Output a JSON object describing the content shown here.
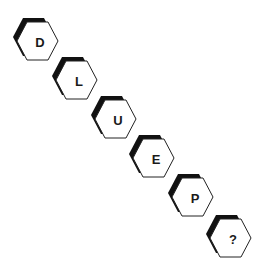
{
  "puzzle": {
    "description": "Sequence of hexagon tiles, each containing a letter; last tile is unknown",
    "tiles": [
      {
        "label": "D",
        "x": 13,
        "y": 16
      },
      {
        "label": "L",
        "x": 52,
        "y": 55
      },
      {
        "label": "U",
        "x": 91,
        "y": 94
      },
      {
        "label": "E",
        "x": 129,
        "y": 133
      },
      {
        "label": "P",
        "x": 168,
        "y": 172
      },
      {
        "label": "?",
        "x": 206,
        "y": 213
      }
    ],
    "colors": {
      "shadow": "#111111",
      "outline": "#222222",
      "fill": "#ffffff",
      "text": "#1a1a1a"
    }
  }
}
